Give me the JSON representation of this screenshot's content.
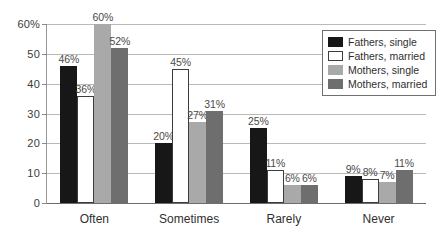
{
  "chart_data": {
    "type": "bar",
    "title": "",
    "xlabel": "",
    "ylabel": "",
    "ylim": [
      0,
      60
    ],
    "grid": true,
    "legend_position": "top-right",
    "categories": [
      "Often",
      "Sometimes",
      "Rarely",
      "Never"
    ],
    "ytick_labels": [
      "0",
      "10",
      "20",
      "30",
      "40",
      "50",
      "60%"
    ],
    "ytick_values": [
      0,
      10,
      20,
      30,
      40,
      50,
      60
    ],
    "series": [
      {
        "name": "Fathers, single",
        "color": "#171717",
        "values": [
          46,
          20,
          25,
          9
        ],
        "labels": [
          "46%",
          "20%",
          "25%",
          "9%"
        ]
      },
      {
        "name": "Fathers, married",
        "color": "#ffffff",
        "values": [
          36,
          45,
          11,
          8
        ],
        "labels": [
          "36%",
          "45%",
          "11%",
          "8%"
        ]
      },
      {
        "name": "Mothers, single",
        "color": "#a9a9a9",
        "values": [
          60,
          27,
          6,
          7
        ],
        "labels": [
          "60%",
          "27%",
          "6%",
          "7%"
        ]
      },
      {
        "name": "Mothers, married",
        "color": "#6e6e6e",
        "values": [
          52,
          31,
          6,
          11
        ],
        "labels": [
          "52%",
          "31%",
          "6%",
          "11%"
        ]
      }
    ]
  }
}
